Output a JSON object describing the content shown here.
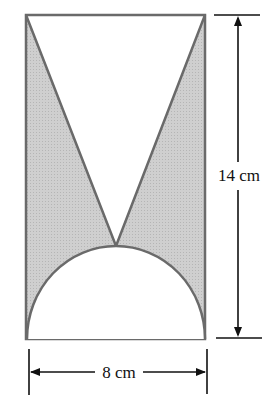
{
  "diagram": {
    "height_label": "14 cm",
    "width_label": "8 cm",
    "colors": {
      "shade": "#c9c9c9",
      "outline": "#6a6a6a",
      "dimension": "#111111"
    }
  }
}
